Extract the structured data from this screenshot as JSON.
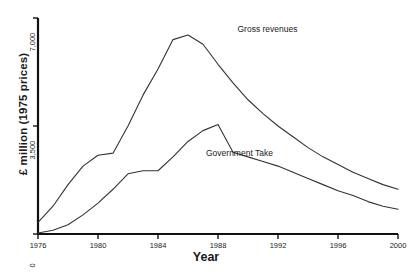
{
  "chart_data": {
    "type": "line",
    "title": "",
    "xlabel": "Year",
    "ylabel": "£ million (1975 prices)",
    "xlim": [
      1976,
      2000
    ],
    "ylim": [
      0,
      7000
    ],
    "grid": false,
    "legend_position": "inline-annotation",
    "x_ticks": [
      "1976",
      "1980",
      "1984",
      "1988",
      "1992",
      "1996",
      "2000"
    ],
    "x_tick_values": [
      1976,
      1980,
      1984,
      1988,
      1992,
      1996,
      2000
    ],
    "y_ticks": [
      "0",
      "3,500",
      "7,000"
    ],
    "y_tick_values": [
      0,
      3500,
      7000
    ],
    "series": [
      {
        "name": "Gross revenues",
        "label": "Gross revenues",
        "color": "#333333",
        "x": [
          1976,
          1977,
          1978,
          1979,
          1980,
          1981,
          1982,
          1983,
          1984,
          1985,
          1986,
          1987,
          1988,
          1989,
          1990,
          1991,
          1992,
          1993,
          1994,
          1995,
          1996,
          1997,
          1998,
          1999,
          2000
        ],
        "values": [
          380,
          900,
          1600,
          2200,
          2550,
          2620,
          3500,
          4500,
          5350,
          6300,
          6450,
          6150,
          5500,
          4900,
          4350,
          3900,
          3500,
          3150,
          2800,
          2500,
          2250,
          2000,
          1800,
          1600,
          1450
        ]
      },
      {
        "name": "Government Take",
        "label": "Government Take",
        "color": "#333333",
        "x": [
          1976,
          1977,
          1978,
          1979,
          1980,
          1981,
          1982,
          1983,
          1984,
          1985,
          1986,
          1987,
          1988,
          1989,
          1990,
          1991,
          1992,
          1993,
          1994,
          1995,
          1996,
          1997,
          1998,
          1999,
          2000
        ],
        "values": [
          30,
          120,
          300,
          620,
          1000,
          1450,
          1950,
          2050,
          2050,
          2500,
          3000,
          3350,
          3550,
          2650,
          2500,
          2350,
          2200,
          2000,
          1800,
          1600,
          1400,
          1250,
          1050,
          900,
          800
        ]
      }
    ],
    "annotations": [
      {
        "name": "gross-revenues-label",
        "text": "Gross revenues",
        "x": 1989.3,
        "y": 6600
      },
      {
        "name": "government-take-label",
        "text": "Government Take",
        "x": 1987.2,
        "y": 2600
      }
    ]
  }
}
